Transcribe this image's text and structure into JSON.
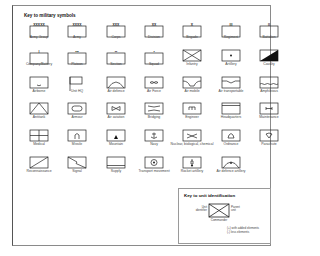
{
  "title": "Key to military symbols",
  "rows": [
    [
      {
        "label": "Army Group",
        "mark": "XXXXX"
      },
      {
        "label": "Army",
        "mark": "XXXX"
      },
      {
        "label": "Corps",
        "mark": "XXX"
      },
      {
        "label": "Division",
        "mark": "XX"
      },
      {
        "label": "Brigade",
        "mark": "X"
      },
      {
        "label": "Regiment",
        "mark": "III"
      },
      {
        "label": "Battalion",
        "mark": "II"
      }
    ],
    [
      {
        "label": "Company/Battery",
        "mark": "I"
      },
      {
        "label": "Platoon",
        "mark": "•••"
      },
      {
        "label": "Section",
        "mark": "••"
      },
      {
        "label": "Squad",
        "mark": "•"
      },
      {
        "label": "Infantry",
        "icon": "infantry"
      },
      {
        "label": "Artillery",
        "icon": "artillery"
      },
      {
        "label": "Cavalry",
        "icon": "cavalry"
      }
    ],
    [
      {
        "label": "Airborne",
        "icon": "airborne"
      },
      {
        "label": "Unit HQ",
        "icon": "unit-hq"
      },
      {
        "label": "Air defence",
        "icon": "air-defence"
      },
      {
        "label": "Air Force",
        "icon": "air-force"
      },
      {
        "label": "Air mobile",
        "icon": "air-mobile"
      },
      {
        "label": "Air transportable",
        "icon": "air-transportable"
      },
      {
        "label": "Amphibious",
        "icon": "amphibious"
      }
    ],
    [
      {
        "label": "Antitank",
        "icon": "antitank"
      },
      {
        "label": "Armour",
        "icon": "armour"
      },
      {
        "label": "Air aviation",
        "icon": "air-aviation"
      },
      {
        "label": "Bridging",
        "icon": "bridging"
      },
      {
        "label": "Engineer",
        "icon": "engineer"
      },
      {
        "label": "Headquarters",
        "icon": "headquarters"
      },
      {
        "label": "Maintenance",
        "icon": "maintenance"
      }
    ],
    [
      {
        "label": "Medical",
        "icon": "medical"
      },
      {
        "label": "Missile",
        "icon": "missile"
      },
      {
        "label": "Mountain",
        "icon": "mountain"
      },
      {
        "label": "Navy",
        "icon": "navy"
      },
      {
        "label": "Nuclear, biological, chemical",
        "icon": "nbc"
      },
      {
        "label": "Ordnance",
        "icon": "ordnance"
      },
      {
        "label": "Parachute",
        "icon": "parachute"
      }
    ],
    [
      {
        "label": "Reconnaissance",
        "icon": "reconnaissance"
      },
      {
        "label": "Signal",
        "icon": "signal"
      },
      {
        "label": "Supply",
        "icon": "supply"
      },
      {
        "label": "Transport movement",
        "icon": "transport-movement"
      },
      {
        "label": "Rocket artillery",
        "icon": "rocket-artillery"
      },
      {
        "label": "Air defence artillery",
        "icon": "air-defence-artillery"
      }
    ]
  ],
  "key": {
    "title": "Key to unit identification",
    "unit_identifier": "Unit identifier",
    "parent_unit": "Parent unit",
    "commander": "Commander",
    "with_added": "(+) with added elements",
    "less": "(-) less elements"
  }
}
